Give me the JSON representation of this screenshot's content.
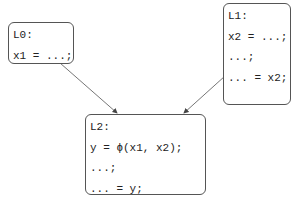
{
  "diagram": {
    "type": "control-flow-graph",
    "blocks": [
      {
        "id": "L0",
        "label": "L0:",
        "lines": [
          "x1 = ...;"
        ]
      },
      {
        "id": "L1",
        "label": "L1:",
        "lines": [
          "x2 = ...;",
          "...;",
          "... = x2;"
        ]
      },
      {
        "id": "L2",
        "label": "L2:",
        "lines": [
          "y = ϕ(x1, x2);",
          "...;",
          "... = y;"
        ]
      }
    ],
    "edges": [
      {
        "from": "L0",
        "to": "L2"
      },
      {
        "from": "L1",
        "to": "L2"
      }
    ],
    "colors": {
      "stroke": "#555555",
      "text": "#222222",
      "background": "#ffffff"
    }
  }
}
